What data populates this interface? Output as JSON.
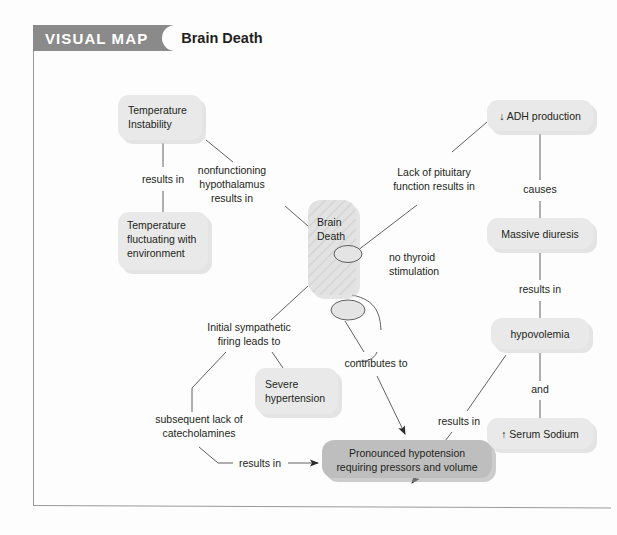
{
  "header": {
    "tag_label": "VISUAL MAP",
    "title": "Brain Death"
  },
  "diagram": {
    "type": "concept-map",
    "central_node": {
      "id": "brain-death",
      "label_line1": "Brain",
      "label_line2": "Death"
    },
    "nodes": [
      {
        "id": "temperature-instability",
        "lines": [
          "Temperature",
          "Instability"
        ],
        "align": "center",
        "emphasis": "normal"
      },
      {
        "id": "temperature-fluctuating",
        "lines": [
          "Temperature",
          "fluctuating with",
          "environment"
        ],
        "align": "left",
        "emphasis": "normal"
      },
      {
        "id": "adh-production",
        "lines": [
          "↓ ADH production"
        ],
        "align": "center",
        "emphasis": "normal"
      },
      {
        "id": "massive-diuresis",
        "lines": [
          "Massive diuresis"
        ],
        "align": "center",
        "emphasis": "normal"
      },
      {
        "id": "hypovolemia",
        "lines": [
          "hypovolemia"
        ],
        "align": "center",
        "emphasis": "normal"
      },
      {
        "id": "serum-sodium",
        "lines": [
          "↑ Serum Sodium"
        ],
        "align": "center",
        "emphasis": "normal"
      },
      {
        "id": "severe-hypertension",
        "lines": [
          "Severe",
          "hypertension"
        ],
        "align": "left",
        "emphasis": "normal"
      },
      {
        "id": "pronounced-hypotension",
        "lines": [
          "Pronounced hypotension",
          "requiring pressors and volume"
        ],
        "align": "center",
        "emphasis": "dark"
      }
    ],
    "edge_labels": [
      {
        "id": "results-in-temperature",
        "lines": [
          "results in"
        ]
      },
      {
        "id": "nonfunctioning-hypothalamus",
        "lines": [
          "nonfunctioning",
          "hypothalamus",
          "results in"
        ]
      },
      {
        "id": "lack-of-pituitary",
        "lines": [
          "Lack of pituitary",
          "function results in"
        ]
      },
      {
        "id": "no-thyroid-stimulation",
        "lines": [
          "no thyroid",
          "stimulation"
        ]
      },
      {
        "id": "causes",
        "lines": [
          "causes"
        ]
      },
      {
        "id": "results-in-diuresis",
        "lines": [
          "results in"
        ]
      },
      {
        "id": "and",
        "lines": [
          "and"
        ]
      },
      {
        "id": "initial-sympathetic-firing",
        "lines": [
          "Initial sympathetic",
          "firing leads to"
        ]
      },
      {
        "id": "subsequent-lack-catecholamines",
        "lines": [
          "subsequent lack of",
          "catecholamines"
        ]
      },
      {
        "id": "contributes-to",
        "lines": [
          "contributes to"
        ]
      },
      {
        "id": "results-in-hypovolemia",
        "lines": [
          "results in"
        ]
      },
      {
        "id": "results-in-catecholamines",
        "lines": [
          "results in"
        ]
      }
    ]
  },
  "colors": {
    "banner": "#8a8a8a",
    "node_fill": "#e9e9e9",
    "node_fill_dark": "#bebebe",
    "text": "#231f20",
    "line": "#4f4f4f",
    "border": "#9a9a9a"
  }
}
